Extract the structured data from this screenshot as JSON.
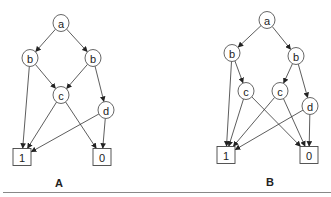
{
  "diagrams": [
    {
      "caption": "A",
      "nodes": [
        {
          "id": "a",
          "label": "a",
          "shape": "ellipse",
          "x": 61,
          "y": 23
        },
        {
          "id": "b1",
          "label": "b",
          "shape": "ellipse",
          "x": 30,
          "y": 58
        },
        {
          "id": "b2",
          "label": "b",
          "shape": "ellipse",
          "x": 93,
          "y": 58
        },
        {
          "id": "c",
          "label": "c",
          "shape": "ellipse",
          "x": 61,
          "y": 95
        },
        {
          "id": "d",
          "label": "d",
          "shape": "ellipse",
          "x": 106,
          "y": 110
        },
        {
          "id": "one",
          "label": "1",
          "shape": "box",
          "x": 22,
          "y": 157
        },
        {
          "id": "zero",
          "label": "0",
          "shape": "box",
          "x": 102,
          "y": 157
        }
      ],
      "edges": [
        [
          "a",
          "b1"
        ],
        [
          "a",
          "b2"
        ],
        [
          "b1",
          "one"
        ],
        [
          "b1",
          "c"
        ],
        [
          "b2",
          "c"
        ],
        [
          "b2",
          "d"
        ],
        [
          "c",
          "one"
        ],
        [
          "c",
          "zero"
        ],
        [
          "d",
          "one"
        ],
        [
          "d",
          "zero"
        ]
      ]
    },
    {
      "caption": "B",
      "nodes": [
        {
          "id": "a",
          "label": "a",
          "shape": "ellipse",
          "x": 267,
          "y": 20
        },
        {
          "id": "b1",
          "label": "b",
          "shape": "ellipse",
          "x": 232,
          "y": 53
        },
        {
          "id": "b2",
          "label": "b",
          "shape": "ellipse",
          "x": 296,
          "y": 56
        },
        {
          "id": "c1",
          "label": "c",
          "shape": "ellipse",
          "x": 246,
          "y": 91
        },
        {
          "id": "c2",
          "label": "c",
          "shape": "ellipse",
          "x": 280,
          "y": 91
        },
        {
          "id": "d",
          "label": "d",
          "shape": "ellipse",
          "x": 310,
          "y": 106
        },
        {
          "id": "one",
          "label": "1",
          "shape": "box",
          "x": 226,
          "y": 155
        },
        {
          "id": "zero",
          "label": "0",
          "shape": "box",
          "x": 309,
          "y": 155
        }
      ],
      "edges": [
        [
          "a",
          "b1"
        ],
        [
          "a",
          "b2"
        ],
        [
          "b1",
          "one"
        ],
        [
          "b1",
          "c1"
        ],
        [
          "b2",
          "c2"
        ],
        [
          "b2",
          "d"
        ],
        [
          "c1",
          "one"
        ],
        [
          "c1",
          "zero"
        ],
        [
          "c2",
          "one"
        ],
        [
          "c2",
          "zero"
        ],
        [
          "d",
          "one"
        ],
        [
          "d",
          "zero"
        ]
      ]
    }
  ],
  "caption_positions": [
    {
      "x": 59,
      "y": 183
    },
    {
      "x": 270,
      "y": 182
    }
  ],
  "colors": {
    "stroke": "#333333",
    "fill": "#ffffff",
    "rule": "#888888"
  }
}
